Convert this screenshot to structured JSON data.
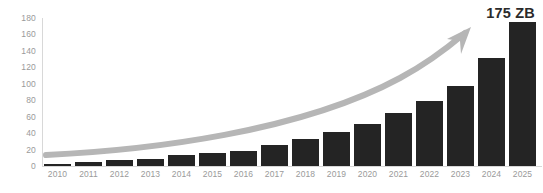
{
  "chart_data": {
    "type": "bar",
    "title": "",
    "xlabel": "",
    "ylabel": "",
    "categories": [
      "2010",
      "2011",
      "2012",
      "2013",
      "2014",
      "2015",
      "2016",
      "2017",
      "2018",
      "2019",
      "2020",
      "2021",
      "2022",
      "2023",
      "2024",
      "2025"
    ],
    "values": [
      2,
      5,
      7,
      9,
      13,
      16,
      18,
      26,
      33,
      41,
      51,
      65,
      79,
      97,
      131,
      175
    ],
    "ylim": [
      0,
      180
    ],
    "y_ticks": [
      "0",
      "20",
      "40",
      "60",
      "80",
      "100",
      "120",
      "140",
      "160",
      "180"
    ],
    "y_tick_values": [
      0,
      20,
      40,
      60,
      80,
      100,
      120,
      140,
      160,
      180
    ],
    "grid": false,
    "legend": "none",
    "annotations": [
      {
        "name": "final-value-annotation",
        "text": "175 ZB",
        "target_category": "2025",
        "target_value": 175
      }
    ],
    "overlays": [
      {
        "name": "growth-trend-arrow",
        "type": "curved-arrow",
        "direction": "up-right",
        "color": "#b6b6b6"
      }
    ],
    "colors": {
      "bar": "#242424",
      "arrow": "#b6b6b6",
      "axis": "#d8d8d8",
      "tick_label": "#9a9a9a",
      "annotation": "#2b2b2b",
      "background": "#ffffff"
    }
  }
}
